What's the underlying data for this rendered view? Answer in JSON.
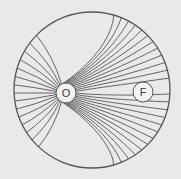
{
  "diagram": {
    "type": "field-lines-in-disk",
    "colors": {
      "background": "#e9e9e7",
      "stroke": "#555555",
      "node_fill": "#f2f2f0"
    },
    "boundary": {
      "cx": 92,
      "cy": 90,
      "r": 78
    },
    "nodes": [
      {
        "id": "O",
        "label": "O",
        "cx": 66,
        "cy": 93,
        "r": 10
      },
      {
        "id": "F",
        "label": "F",
        "cx": 143,
        "cy": 92,
        "r": 10
      }
    ],
    "line_count": 40
  }
}
